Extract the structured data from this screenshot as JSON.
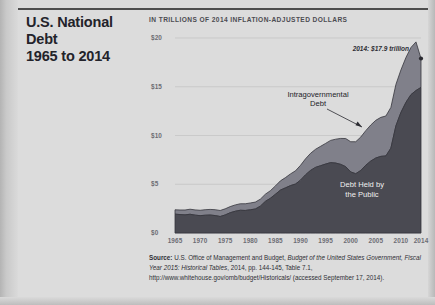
{
  "header": {
    "title_line1": "U.S. National Debt",
    "title_line2": "1965 to 2014",
    "subtitle": "IN TRILLIONS OF 2014 INFLATION-ADJUSTED DOLLARS"
  },
  "annotations": {
    "peak": "2014: $17.9 trillion",
    "intragovernmental_line1": "Intragovernmental",
    "intragovernmental_line2": "Debt",
    "public_line1": "Debt Held by",
    "public_line2": "the Public"
  },
  "source": {
    "label": "Source:",
    "text_1": " U.S. Office of Management and Budget, ",
    "italic_1": "Budget of the United States Government, Fiscal Year 2015: Historical Tables",
    "text_2": ", 2014, pp. 144-145, Table 7.1, http://www.whitehouse.gov/omb/budget/Historicals/ (accessed September 17, 2014)."
  },
  "colors": {
    "page_background": "#dcdcdc",
    "public_debt_area": "#4a4a52",
    "intragovernmental_area": "#80808a",
    "gridline": "#c2c2c2",
    "axis_text": "#6d6d74",
    "title_text": "#23232a"
  },
  "chart_data": {
    "type": "area",
    "stacked": true,
    "title": "U.S. National Debt 1965 to 2014",
    "subtitle": "IN TRILLIONS OF 2014 INFLATION-ADJUSTED DOLLARS",
    "xlabel": "",
    "ylabel": "Trillions of 2014 inflation-adjusted dollars",
    "xlim": [
      1965,
      2014
    ],
    "ylim": [
      0,
      20
    ],
    "ytick_labels": [
      "$0",
      "$5",
      "$10",
      "$15",
      "$20"
    ],
    "ytick_values": [
      0,
      5,
      10,
      15,
      20
    ],
    "xtick_labels": [
      "1965",
      "1970",
      "1975",
      "1980",
      "1985",
      "1990",
      "1995",
      "2000",
      "2005",
      "2010",
      "2014"
    ],
    "xtick_values": [
      1965,
      1970,
      1975,
      1980,
      1985,
      1990,
      1995,
      2000,
      2005,
      2010,
      2014
    ],
    "grid": true,
    "legend_position": "inline-annotations",
    "x": [
      1965,
      1966,
      1967,
      1968,
      1969,
      1970,
      1971,
      1972,
      1973,
      1974,
      1975,
      1976,
      1977,
      1978,
      1979,
      1980,
      1981,
      1982,
      1983,
      1984,
      1985,
      1986,
      1987,
      1988,
      1989,
      1990,
      1991,
      1992,
      1993,
      1994,
      1995,
      1996,
      1997,
      1998,
      1999,
      2000,
      2001,
      2002,
      2003,
      2004,
      2005,
      2006,
      2007,
      2008,
      2009,
      2010,
      2011,
      2012,
      2013,
      2014
    ],
    "series": [
      {
        "name": "Debt Held by the Public",
        "color": "#4a4a52",
        "values": [
          1.93,
          1.89,
          1.86,
          1.92,
          1.83,
          1.78,
          1.82,
          1.84,
          1.79,
          1.69,
          1.85,
          2.08,
          2.23,
          2.33,
          2.31,
          2.38,
          2.46,
          2.75,
          3.24,
          3.56,
          3.97,
          4.4,
          4.63,
          4.86,
          5.02,
          5.42,
          5.97,
          6.42,
          6.73,
          6.9,
          7.07,
          7.22,
          7.17,
          7.04,
          6.8,
          6.26,
          6.08,
          6.41,
          6.95,
          7.38,
          7.69,
          7.86,
          7.9,
          8.7,
          10.98,
          12.36,
          13.4,
          14.19,
          14.61,
          14.93
        ],
        "units": "trillions of 2014 dollars"
      },
      {
        "name": "Intragovernmental Debt",
        "color": "#80808a",
        "values": [
          0.45,
          0.47,
          0.5,
          0.52,
          0.54,
          0.55,
          0.57,
          0.58,
          0.6,
          0.62,
          0.63,
          0.63,
          0.65,
          0.67,
          0.69,
          0.7,
          0.71,
          0.72,
          0.74,
          0.78,
          0.86,
          0.95,
          1.05,
          1.2,
          1.36,
          1.52,
          1.64,
          1.75,
          1.86,
          1.99,
          2.12,
          2.28,
          2.45,
          2.66,
          2.89,
          3.1,
          3.28,
          3.43,
          3.55,
          3.7,
          3.87,
          4.0,
          4.1,
          4.18,
          4.25,
          4.36,
          4.6,
          4.84,
          4.99,
          2.97
        ],
        "units": "trillions of 2014 dollars"
      }
    ],
    "total_2014": 17.9,
    "annotations": [
      {
        "text": "2014: $17.9 trillion",
        "x": 2014,
        "y": 17.9
      },
      {
        "text": "Intragovernmental Debt",
        "x": 2009,
        "y": 11.5
      },
      {
        "text": "Debt Held by the Public",
        "x": 2004,
        "y": 3.5
      }
    ]
  }
}
